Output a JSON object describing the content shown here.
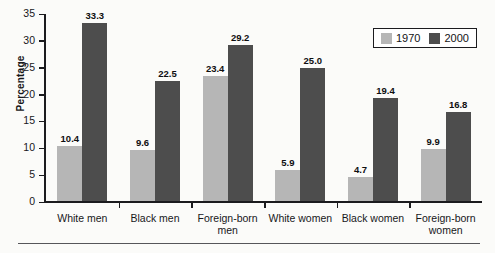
{
  "chart_data": {
    "type": "bar",
    "title": "",
    "xlabel": "",
    "ylabel": "Percentage",
    "ylim": [
      0,
      35
    ],
    "yticks": [
      0,
      5,
      10,
      15,
      20,
      25,
      30,
      35
    ],
    "grid": false,
    "legend_position": "top-right",
    "categories": [
      "White men",
      "Black men",
      "Foreign-born men",
      "White women",
      "Black women",
      "Foreign-born women"
    ],
    "series": [
      {
        "name": "1970",
        "color": "#b6b6b6",
        "values": [
          10.4,
          9.6,
          23.4,
          5.9,
          4.7,
          9.9
        ],
        "labels": [
          "10.4",
          "9.6",
          "23.4",
          "5.9",
          "4.7",
          "9.9"
        ]
      },
      {
        "name": "2000",
        "color": "#4d4d4d",
        "values": [
          33.3,
          22.5,
          29.2,
          25.0,
          19.4,
          16.8
        ],
        "labels": [
          "33.3",
          "22.5",
          "29.2",
          "25.0",
          "19.4",
          "16.8"
        ]
      }
    ]
  },
  "axis": {
    "y_title": "Percentage",
    "y_tick_labels": [
      "35",
      "30",
      "25",
      "20",
      "15",
      "10",
      "5",
      "0"
    ]
  },
  "category_lines": [
    [
      "White men"
    ],
    [
      "Black men"
    ],
    [
      "Foreign-born",
      "men"
    ],
    [
      "White women"
    ],
    [
      "Black women"
    ],
    [
      "Foreign-born",
      "women"
    ]
  ],
  "legend": {
    "entries": [
      {
        "label": "1970",
        "color": "#b6b6b6"
      },
      {
        "label": "2000",
        "color": "#4d4d4d"
      }
    ]
  }
}
